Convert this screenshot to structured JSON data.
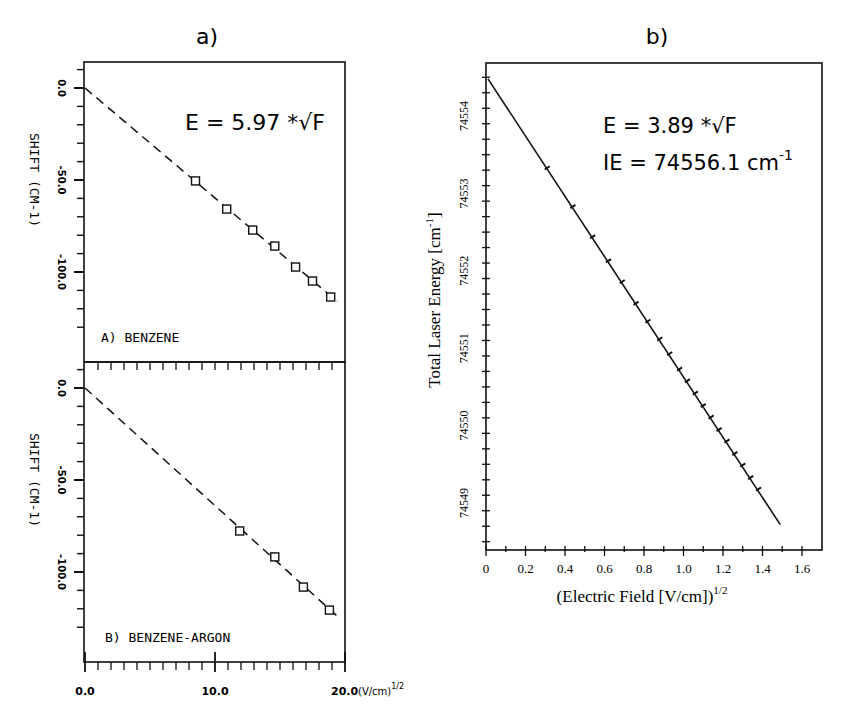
{
  "figure": {
    "panel_a_label": "a)",
    "panel_b_label": "b)"
  },
  "chart_data": [
    {
      "type": "scatter",
      "id": "a-top",
      "title": "A) BENZENE",
      "annotation": "E = 5.97 *√F",
      "xlabel": "",
      "ylabel": "SHIFT (CM-1)",
      "xlim": [
        0,
        20
      ],
      "ylim": [
        -140,
        14
      ],
      "yticks": [
        "0.0",
        "-50.0",
        "-100.0"
      ],
      "ytick_values": [
        0,
        -50,
        -100
      ],
      "grid": false,
      "series": [
        {
          "name": "measured",
          "marker": "square",
          "x": [
            8.5,
            10.9,
            12.9,
            14.6,
            16.2,
            17.5,
            18.9
          ],
          "y": [
            -50.5,
            -65.8,
            -77.2,
            -85.9,
            -97.3,
            -104.9,
            -113.6
          ]
        },
        {
          "name": "fit E = 5.97*sqrt(F)",
          "style": "dashed",
          "x": [
            0,
            19.4
          ],
          "y": [
            0,
            -116
          ]
        }
      ]
    },
    {
      "type": "scatter",
      "id": "a-bottom",
      "title": "B) BENZENE-ARGON",
      "xlabel": "(V/cm)^1/2",
      "ylabel": "SHIFT (CM-1)",
      "xlim": [
        0,
        20
      ],
      "ylim": [
        -140,
        14
      ],
      "xticks": [
        "0.0",
        "10.0",
        "20.0"
      ],
      "xtick_values": [
        0,
        10,
        20
      ],
      "yticks": [
        "0.0",
        "-50.0",
        "-100.0"
      ],
      "ytick_values": [
        0,
        -50,
        -100
      ],
      "grid": false,
      "series": [
        {
          "name": "measured",
          "marker": "square",
          "x": [
            11.9,
            14.6,
            16.8,
            18.8
          ],
          "y": [
            -77.7,
            -91.8,
            -108.2,
            -120.7
          ]
        },
        {
          "name": "fit",
          "style": "dashed",
          "x": [
            0,
            19.4
          ],
          "y": [
            0,
            -124
          ]
        }
      ]
    },
    {
      "type": "line",
      "id": "b",
      "title": "",
      "annotation_1": "E = 3.89 *√F",
      "annotation_2": "IE = 74556.1  cm",
      "annotation_2_sup": "-1",
      "xlabel": "(Electric Field [V/cm])",
      "xlabel_sup": "1/2",
      "ylabel": "Total Laser Energy [cm",
      "ylabel_sup": "-1",
      "ylabel_end": "]",
      "xlim": [
        0,
        1.7
      ],
      "ylim": [
        74548.4,
        74554.7
      ],
      "xticks": [
        "0",
        "0.2",
        "0.4",
        "0.6",
        "0.8",
        "1.0",
        "1.2",
        "1.4",
        "1.6"
      ],
      "xtick_values": [
        0,
        0.2,
        0.4,
        0.6,
        0.8,
        1.0,
        1.2,
        1.4,
        1.6
      ],
      "yticks": [
        "74549",
        "74550",
        "74551",
        "74552",
        "74553",
        "74554"
      ],
      "ytick_values": [
        74549,
        74550,
        74551,
        74552,
        74553,
        74554
      ],
      "grid": false,
      "series": [
        {
          "name": "fit",
          "style": "solid",
          "x": [
            0.01,
            1.49
          ],
          "y": [
            74554.48,
            74548.72
          ]
        },
        {
          "name": "measured",
          "marker": "tick",
          "x": [
            0.31,
            0.44,
            0.54,
            0.62,
            0.69,
            0.76,
            0.82,
            0.88,
            0.93,
            0.98,
            1.02,
            1.06,
            1.1,
            1.14,
            1.18,
            1.22,
            1.26,
            1.3,
            1.34,
            1.38
          ],
          "y": [
            74553.33,
            74552.83,
            74552.44,
            74552.13,
            74551.86,
            74551.58,
            74551.35,
            74551.12,
            74550.93,
            74550.73,
            74550.58,
            74550.42,
            74550.26,
            74550.11,
            74549.95,
            74549.8,
            74549.64,
            74549.49,
            74549.33,
            74549.18
          ]
        }
      ]
    }
  ]
}
